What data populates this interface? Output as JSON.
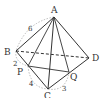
{
  "figure": {
    "type": "tetrahedron",
    "points": {
      "A": {
        "label": "A",
        "x": 54,
        "y": 17
      },
      "B": {
        "label": "B",
        "x": 16,
        "y": 51
      },
      "C": {
        "label": "C",
        "x": 48,
        "y": 89
      },
      "D": {
        "label": "D",
        "x": 89,
        "y": 58
      },
      "P": {
        "label": "P",
        "x": 28,
        "y": 66
      },
      "Q": {
        "label": "Q",
        "x": 69,
        "y": 72
      }
    },
    "edge_labels": {
      "AB": "6",
      "BP": "2",
      "PC": "4",
      "CQ": "3"
    },
    "solid_edges": [
      "AB",
      "AC",
      "AD",
      "BC",
      "CD",
      "AP",
      "AQ",
      "PD"
    ],
    "dashed_edges": [
      "BD"
    ],
    "dotted_arcs": [
      "AB",
      "BP",
      "PC",
      "CQ"
    ]
  }
}
